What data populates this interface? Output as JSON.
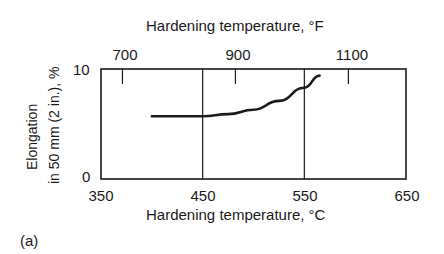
{
  "chart_data": {
    "type": "line",
    "title": "",
    "xlabel": "Hardening temperature, °C",
    "x2label": "Hardening temperature, °F",
    "ylabel_line1": "Elongation",
    "ylabel_line2": "in 50 mm (2 in.), %",
    "xlim": [
      350,
      650
    ],
    "ylim": [
      0,
      10
    ],
    "x_ticks": [
      "350",
      "450",
      "550",
      "650"
    ],
    "x2_ticks": [
      "700",
      "900",
      "1100"
    ],
    "y_ticks": [
      "0",
      "10"
    ],
    "grid_vertical_at": [
      450,
      550
    ],
    "series": [
      {
        "name": "Elongation",
        "x": [
          400,
          450,
          475,
          500,
          525,
          550,
          565
        ],
        "y": [
          5.7,
          5.7,
          5.9,
          6.3,
          7.1,
          8.3,
          9.4
        ]
      }
    ],
    "panel_label": "(a)"
  }
}
